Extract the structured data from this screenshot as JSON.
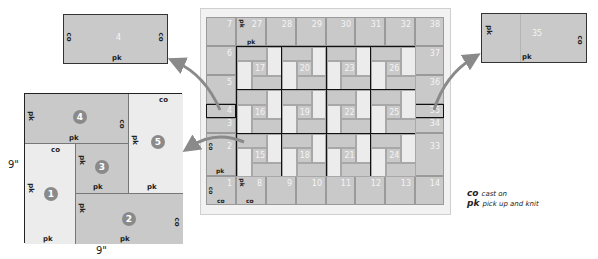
{
  "colors": {
    "dark_piece": "#c9c9c9",
    "light_piece": "#ececec",
    "arrow": "#8a8a8a",
    "badge": "#8a8a8a",
    "frame_bg": "#f2f2f2"
  },
  "top_left_piece": {
    "number": "4",
    "left_label": "co",
    "right_label": "co",
    "bottom_label": "pk"
  },
  "top_right_piece": {
    "number": "35",
    "left_label": "pk",
    "right_label": "co",
    "bottom_label": "pk"
  },
  "square": {
    "width_label": "9\"",
    "height_label": "9\"",
    "pieces": [
      {
        "number": "1",
        "labels": {
          "top": "co",
          "left": "pk",
          "bottom": "pk"
        }
      },
      {
        "number": "2",
        "labels": {
          "left": "pk",
          "right": "co",
          "bottom": "pk"
        }
      },
      {
        "number": "3",
        "labels": {
          "left": "pk",
          "bottom": "pk"
        }
      },
      {
        "number": "4",
        "labels": {
          "left": "pk",
          "right": "co",
          "bottom": "pk"
        }
      },
      {
        "number": "5",
        "labels": {
          "top": "co",
          "left": "pk",
          "bottom": "pk"
        }
      }
    ]
  },
  "grid": {
    "top_row": [
      "7",
      "27",
      "28",
      "29",
      "30",
      "31",
      "32",
      "38"
    ],
    "bottom_row": [
      "1",
      "8",
      "9",
      "10",
      "11",
      "12",
      "13",
      "14"
    ],
    "left_col": [
      "6",
      "5",
      "4",
      "3",
      "2"
    ],
    "right_col": [
      "37",
      "36",
      "35",
      "34",
      "33"
    ],
    "blocks": [
      [
        "17",
        "20",
        "23",
        "26"
      ],
      [
        "16",
        "19",
        "22",
        "25"
      ],
      [
        "15",
        "18",
        "21",
        "24"
      ]
    ],
    "annotations": {
      "cell_27_pk_side": "pk",
      "cell_27_pk_bottom": "pk",
      "cell_2_co": "co",
      "cell_2_pk": "pk",
      "cell_1_co_side": "co",
      "cell_1_co_bottom": "co",
      "cell_8_pk_side": "pk",
      "cell_8_co_bottom": "co"
    }
  },
  "legend": [
    {
      "abbr": "co",
      "text": "cast on"
    },
    {
      "abbr": "pk",
      "text": "pick up and knit"
    }
  ]
}
